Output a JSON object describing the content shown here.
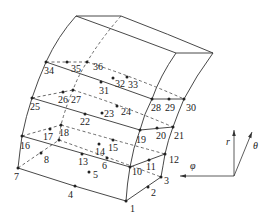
{
  "figure": {
    "type": "20-node curved hexahedral element with 36 nodes (solid/shell element in spherical coordinates)",
    "width": 271,
    "height": 221,
    "stroke_color": "#333333"
  },
  "nodes": [
    {
      "id": "1",
      "x": 126,
      "y": 201,
      "lx": 130,
      "ly": 212
    },
    {
      "id": "2",
      "x": 148,
      "y": 187,
      "lx": 151,
      "ly": 196
    },
    {
      "id": "3",
      "x": 161,
      "y": 177,
      "lx": 164,
      "ly": 184
    },
    {
      "id": "4",
      "x": 75,
      "y": 186,
      "lx": 68,
      "ly": 198
    },
    {
      "id": "5",
      "x": 89,
      "y": 172,
      "lx": 93,
      "ly": 178
    },
    {
      "id": "6",
      "x": 107,
      "y": 158,
      "lx": 102,
      "ly": 169
    },
    {
      "id": "7",
      "x": 18,
      "y": 168,
      "lx": 14,
      "ly": 180
    },
    {
      "id": "8",
      "x": 41,
      "y": 153,
      "lx": 44,
      "ly": 163
    },
    {
      "id": "9",
      "x": 59,
      "y": 140,
      "lx": null,
      "ly": null
    },
    {
      "id": "10",
      "x": 130,
      "y": 167,
      "lx": 132,
      "ly": 175
    },
    {
      "id": "11",
      "x": 149,
      "y": 160,
      "lx": 146,
      "ly": 170
    },
    {
      "id": "12",
      "x": 165,
      "y": 154,
      "lx": 169,
      "ly": 163
    },
    {
      "id": "13",
      "x": 82,
      "y": 154,
      "lx": 78,
      "ly": 165
    },
    {
      "id": "14",
      "x": 99,
      "y": 144,
      "lx": 95,
      "ly": 155
    },
    {
      "id": "15",
      "x": 113,
      "y": 140,
      "lx": 108,
      "ly": 151
    },
    {
      "id": "16",
      "x": 22,
      "y": 136,
      "lx": 20,
      "ly": 149
    },
    {
      "id": "17",
      "x": 50,
      "y": 129,
      "lx": 43,
      "ly": 140
    },
    {
      "id": "18",
      "x": 61,
      "y": 125,
      "lx": 59,
      "ly": 136
    },
    {
      "id": "19",
      "x": 140,
      "y": 130,
      "lx": 136,
      "ly": 143
    },
    {
      "id": "20",
      "x": 157,
      "y": 128,
      "lx": 156,
      "ly": 139
    },
    {
      "id": "21",
      "x": 173,
      "y": 127,
      "lx": 174,
      "ly": 139
    },
    {
      "id": "22",
      "x": 85,
      "y": 114,
      "lx": 80,
      "ly": 125
    },
    {
      "id": "23",
      "x": 102,
      "y": 113,
      "lx": 104,
      "ly": 117
    },
    {
      "id": "24",
      "x": 117,
      "y": 106,
      "lx": 121,
      "ly": 115
    },
    {
      "id": "25",
      "x": 32,
      "y": 98,
      "lx": 30,
      "ly": 110
    },
    {
      "id": "26",
      "x": 63,
      "y": 92,
      "lx": 58,
      "ly": 103
    },
    {
      "id": "27",
      "x": 73,
      "y": 90,
      "lx": 71,
      "ly": 103
    },
    {
      "id": "28",
      "x": 152,
      "y": 99,
      "lx": 151,
      "ly": 111
    },
    {
      "id": "29",
      "x": 169,
      "y": 99,
      "lx": 165,
      "ly": 111
    },
    {
      "id": "30",
      "x": 184,
      "y": 99,
      "lx": 186,
      "ly": 111
    },
    {
      "id": "31",
      "x": 101,
      "y": 82,
      "lx": 99,
      "ly": 94
    },
    {
      "id": "32",
      "x": 113,
      "y": 78,
      "lx": 115,
      "ly": 87
    },
    {
      "id": "33",
      "x": 127,
      "y": 77,
      "lx": 128,
      "ly": 88
    },
    {
      "id": "34",
      "x": 46,
      "y": 62,
      "lx": 44,
      "ly": 74
    },
    {
      "id": "35",
      "x": 67,
      "y": 62,
      "lx": 71,
      "ly": 72
    },
    {
      "id": "36",
      "x": 87,
      "y": 62,
      "lx": 93,
      "ly": 70
    }
  ],
  "axes": {
    "origin": {
      "x": 234,
      "y": 176
    },
    "r": {
      "label": "r",
      "x": 234,
      "y": 130,
      "lx": 226,
      "ly": 145
    },
    "theta": {
      "label": "θ",
      "x": 252,
      "y": 132,
      "lx": 253,
      "ly": 149
    },
    "phi": {
      "label": "φ",
      "x": 180,
      "y": 176,
      "lx": 190,
      "ly": 169
    }
  }
}
